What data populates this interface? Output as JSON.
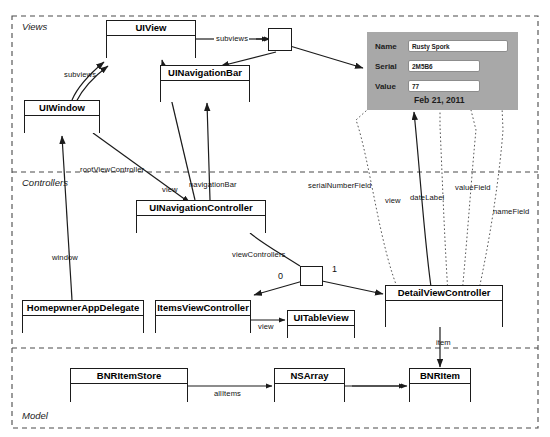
{
  "diagram": {
    "type": "uml-object-diagram",
    "regions": [
      {
        "id": "views",
        "label": "Views"
      },
      {
        "id": "controllers",
        "label": "Controllers"
      },
      {
        "id": "model",
        "label": "Model"
      }
    ],
    "classes": [
      {
        "id": "uiview",
        "name": "UIView"
      },
      {
        "id": "uinavigationbar",
        "name": "UINavigationBar"
      },
      {
        "id": "uiwindow",
        "name": "UIWindow"
      },
      {
        "id": "uinavigationcontroller",
        "name": "UINavigationController"
      },
      {
        "id": "homepwnerappdelegate",
        "name": "HomepwnerAppDelegate"
      },
      {
        "id": "itemsviewcontroller",
        "name": "ItemsViewController"
      },
      {
        "id": "uitableview",
        "name": "UITableView"
      },
      {
        "id": "detailviewcontroller",
        "name": "DetailViewController"
      },
      {
        "id": "bnritemstore",
        "name": "BNRItemStore"
      },
      {
        "id": "nsarray",
        "name": "NSArray"
      },
      {
        "id": "bnritem",
        "name": "BNRItem"
      }
    ],
    "edge_labels": [
      {
        "id": "subviews_top",
        "text": "subviews"
      },
      {
        "id": "subviews_left",
        "text": "subviews"
      },
      {
        "id": "rootviewcontroller",
        "text": "rootViewController"
      },
      {
        "id": "view_nav",
        "text": "view"
      },
      {
        "id": "navigationbar",
        "text": "navigationBar"
      },
      {
        "id": "window",
        "text": "window"
      },
      {
        "id": "viewcontrollers",
        "text": "viewControllers"
      },
      {
        "id": "view_items",
        "text": "view"
      },
      {
        "id": "serialnumberfield",
        "text": "serialNumberField"
      },
      {
        "id": "view_detail",
        "text": "view"
      },
      {
        "id": "datelabel",
        "text": "dateLabel"
      },
      {
        "id": "valuefield",
        "text": "valueField"
      },
      {
        "id": "namefield",
        "text": "nameField"
      },
      {
        "id": "item",
        "text": "item"
      },
      {
        "id": "allitems",
        "text": "allItems"
      }
    ],
    "multiplicities": [
      {
        "id": "mult_zero",
        "text": "0"
      },
      {
        "id": "mult_one",
        "text": "1"
      }
    ]
  },
  "screen_mock": {
    "name": "detail-view-screenshot",
    "fields": [
      {
        "label": "Name",
        "value": "Rusty Spork"
      },
      {
        "label": "Serial",
        "value": "2M5B6"
      },
      {
        "label": "Value",
        "value": "77"
      }
    ],
    "date_label": "Feb 21, 2011"
  },
  "colors": {
    "stroke": "#1b1b1b",
    "screen_background": "#a8a8a8",
    "field_background": "#ffffff",
    "page_background": "#ffffff"
  }
}
